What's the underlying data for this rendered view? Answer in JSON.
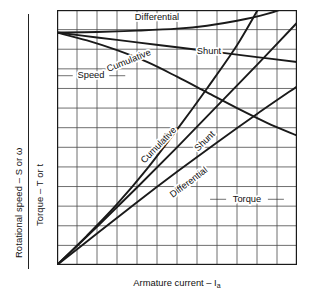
{
  "axes": {
    "y_outer_label": "Rotational speed – S or ω",
    "y_inner_label": "Torque – T or t",
    "x_label_text": "Armature current – I",
    "x_label_subscript": "a"
  },
  "labels": {
    "speed_differential": "Differential",
    "speed_shunt": "Shunt",
    "speed_cumulative": "Cumulative",
    "speed_group": "Speed",
    "torque_cumulative": "Cumulative",
    "torque_shunt": "Shunt",
    "torque_differential": "Differential",
    "torque_group": "Torque"
  },
  "colors": {
    "curve": "#1a1a1a",
    "grid": "#4a4a4a",
    "frame": "#1a1a1a",
    "text": "#111111",
    "background": "#ffffff"
  },
  "chart_data": {
    "type": "line",
    "title": "",
    "xlabel": "Armature current – Ia",
    "ylabel": "Rotational speed – S or ω / Torque – T or t",
    "xlim": [
      0,
      12
    ],
    "ylim": [
      0,
      13
    ],
    "grid": true,
    "legend": "inline-annotations",
    "xticklabels": [],
    "yticklabels": [],
    "series": [
      {
        "name": "Speed – Differential",
        "group": "Speed",
        "points": [
          [
            0,
            11.85
          ],
          [
            2,
            11.88
          ],
          [
            4,
            11.95
          ],
          [
            6,
            12.05
          ],
          [
            7.5,
            12.2
          ],
          [
            9,
            12.45
          ],
          [
            10.5,
            12.8
          ],
          [
            12,
            13.3
          ]
        ]
      },
      {
        "name": "Speed – Shunt",
        "group": "Speed",
        "points": [
          [
            0,
            11.85
          ],
          [
            2,
            11.6
          ],
          [
            4,
            11.35
          ],
          [
            6,
            11.1
          ],
          [
            8,
            10.85
          ],
          [
            10,
            10.6
          ],
          [
            12,
            10.35
          ]
        ]
      },
      {
        "name": "Speed – Cumulative",
        "group": "Speed",
        "points": [
          [
            0,
            11.85
          ],
          [
            1.5,
            11.45
          ],
          [
            3,
            10.95
          ],
          [
            4.5,
            10.35
          ],
          [
            6,
            9.6
          ],
          [
            7.5,
            8.8
          ],
          [
            9,
            8.0
          ],
          [
            10.5,
            7.25
          ],
          [
            12,
            6.6
          ]
        ]
      },
      {
        "name": "Torque – Cumulative",
        "group": "Torque",
        "points": [
          [
            0,
            0
          ],
          [
            1.5,
            1.5
          ],
          [
            3,
            3.1
          ],
          [
            4.5,
            4.9
          ],
          [
            6,
            6.9
          ],
          [
            7.5,
            9.0
          ],
          [
            9,
            11.2
          ],
          [
            10.2,
            13.3
          ]
        ]
      },
      {
        "name": "Torque – Shunt",
        "group": "Torque",
        "points": [
          [
            0,
            0
          ],
          [
            2,
            1.95
          ],
          [
            4,
            3.95
          ],
          [
            6,
            6.0
          ],
          [
            8,
            8.1
          ],
          [
            10,
            10.2
          ],
          [
            12,
            12.35
          ]
        ]
      },
      {
        "name": "Torque – Differential",
        "group": "Torque",
        "points": [
          [
            0,
            0
          ],
          [
            2,
            1.6
          ],
          [
            4,
            3.2
          ],
          [
            6,
            4.75
          ],
          [
            8,
            6.25
          ],
          [
            10,
            7.7
          ],
          [
            12,
            9.1
          ]
        ]
      }
    ],
    "annotations": [
      {
        "text": "Differential",
        "x": 5.0,
        "y": 12.6,
        "series": "Speed – Differential"
      },
      {
        "text": "Shunt",
        "x": 7.6,
        "y": 10.9,
        "series": "Speed – Shunt"
      },
      {
        "text": "Cumulative",
        "x": 3.6,
        "y": 10.4,
        "series": "Speed – Cumulative",
        "rotated": true
      },
      {
        "text": "Speed",
        "x": 1.7,
        "y": 9.65,
        "series": "Speed group",
        "leaders": true
      },
      {
        "text": "Cumulative",
        "x": 5.1,
        "y": 6.1,
        "series": "Torque – Cumulative",
        "rotated": true
      },
      {
        "text": "Shunt",
        "x": 7.4,
        "y": 6.3,
        "series": "Torque – Shunt",
        "rotated": true
      },
      {
        "text": "Differential",
        "x": 6.6,
        "y": 4.2,
        "series": "Torque – Differential",
        "rotated": true
      },
      {
        "text": "Torque",
        "x": 9.5,
        "y": 3.35,
        "series": "Torque group",
        "leaders": true
      }
    ]
  }
}
